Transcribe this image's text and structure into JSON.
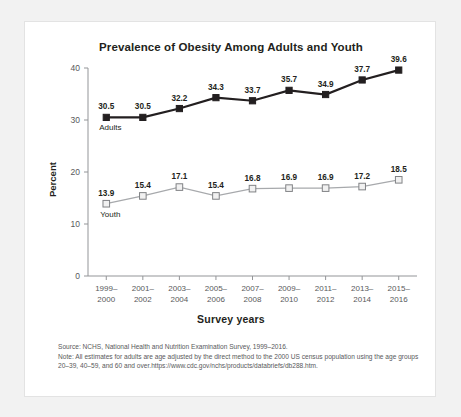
{
  "chart_data": {
    "type": "line",
    "title": "Prevalence of Obesity Among Adults and Youth",
    "xlabel": "Survey years",
    "ylabel": "Percent",
    "ylim": [
      0,
      40
    ],
    "yticks": [
      0,
      10,
      20,
      30,
      40
    ],
    "grid": false,
    "legend_position": "inline-series-labels",
    "categories": [
      "1999–\n2000",
      "2001–\n2002",
      "2003–\n2004",
      "2005–\n2006",
      "2007–\n2008",
      "2009–\n2010",
      "2011–\n2012",
      "2013–\n2014",
      "2015–\n2016"
    ],
    "categories_line1": [
      "1999–",
      "2001–",
      "2003–",
      "2005–",
      "2007–",
      "2009–",
      "2011–",
      "2013–",
      "2015–"
    ],
    "categories_line2": [
      "2000",
      "2002",
      "2004",
      "2006",
      "2008",
      "2010",
      "2012",
      "2014",
      "2016"
    ],
    "series": [
      {
        "name": "Adults",
        "color": "#231f20",
        "marker": "filled-square",
        "values": [
          30.5,
          30.5,
          32.2,
          34.3,
          33.7,
          35.7,
          34.9,
          37.7,
          39.6
        ],
        "value_labels": [
          "30.5",
          "30.5",
          "32.2",
          "34.3",
          "33.7",
          "35.7",
          "34.9",
          "37.7",
          "39.6"
        ]
      },
      {
        "name": "Youth",
        "color": "#a7a9ac",
        "marker": "open-square",
        "values": [
          13.9,
          15.4,
          17.1,
          15.4,
          16.8,
          16.9,
          16.9,
          17.2,
          18.5
        ],
        "value_labels": [
          "13.9",
          "15.4",
          "17.1",
          "15.4",
          "16.8",
          "16.9",
          "16.9",
          "17.2",
          "18.5"
        ]
      }
    ]
  },
  "footnote": {
    "source": "Source: NCHS, National Health and Nutrition Examination Survey, 1999–2016.",
    "note": "Note: All estimates for adults are age adjusted by the direct method to the 2000 US census population using the age groups 20–39, 40–59, and 60 and over.https://www.cdc.gov/nchs/products/databriefs/db288.htm."
  }
}
